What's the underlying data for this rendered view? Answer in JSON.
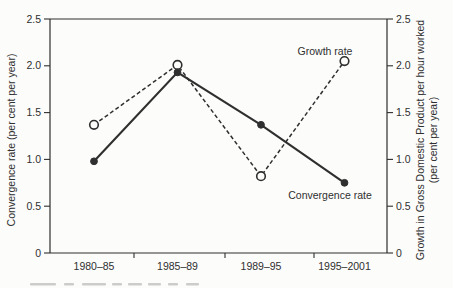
{
  "chart_data": {
    "type": "line",
    "title": "",
    "categories": [
      "1980–85",
      "1985–89",
      "1989–95",
      "1995–2001"
    ],
    "series": [
      {
        "name": "Growth rate",
        "values": [
          1.37,
          2.01,
          0.82,
          2.05
        ],
        "axis": "right",
        "line_style": "dashed",
        "marker": "open-circle"
      },
      {
        "name": "Convergence rate",
        "values": [
          0.98,
          1.93,
          1.37,
          0.75
        ],
        "axis": "left",
        "line_style": "solid",
        "marker": "filled-circle"
      }
    ],
    "left_axis": {
      "label": "Convergence rate (per cent per year)",
      "tick_labels": [
        "2.5",
        "2.0",
        "1.5",
        "1.0",
        "0.5",
        "0"
      ],
      "tick_values": [
        2.5,
        2.0,
        1.5,
        1.0,
        0.5,
        0
      ],
      "range": [
        0,
        2.5
      ]
    },
    "right_axis": {
      "label_line1": "Growth in Gross Domestic Product per hour worked",
      "label_line2": "(per cent per year)",
      "tick_labels": [
        "2.5",
        "2.0",
        "1.5",
        "1.0",
        "0.5",
        "0"
      ],
      "tick_values": [
        2.5,
        2.0,
        1.5,
        1.0,
        0.5,
        0
      ],
      "range": [
        0,
        2.5
      ]
    },
    "annotations": [
      {
        "text": "Growth rate",
        "series": "Growth rate"
      },
      {
        "text": "Convergence rate",
        "series": "Convergence rate"
      }
    ],
    "grid": false,
    "legend_position": "inline-annotations",
    "colors": {
      "ink": "#2f2f2f",
      "background": "#fcfcfb",
      "open_marker_fill": "#fcfcfb",
      "caption_fragment": "#9b9b9b"
    }
  }
}
